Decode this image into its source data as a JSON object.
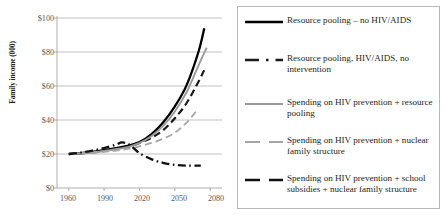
{
  "chart_data": {
    "type": "line",
    "title": "",
    "xlabel": "",
    "ylabel": "Family income (000)",
    "xlim": [
      1950,
      2090
    ],
    "ylim": [
      0,
      100
    ],
    "xticks": [
      "1960",
      "1990",
      "2020",
      "2050",
      "2080"
    ],
    "xtick_values": [
      1960,
      1990,
      2020,
      2050,
      2080
    ],
    "yticks": [
      "$0",
      "$20",
      "$40",
      "$60",
      "$80",
      "$100"
    ],
    "ytick_values": [
      0,
      20,
      40,
      60,
      80,
      100
    ],
    "grid": "horizontal",
    "legend_position": "right",
    "series": [
      {
        "name": "Resource pooling – no HIV/AIDS",
        "color": "#000000",
        "style": "solid",
        "width": 2.3,
        "x": [
          1960,
          1970,
          1980,
          1990,
          2000,
          2010,
          2020,
          2030,
          2040,
          2050,
          2060,
          2070,
          2075
        ],
        "values": [
          20,
          20.5,
          21.2,
          22.2,
          23.4,
          24.8,
          27.0,
          31.5,
          38.5,
          48.0,
          60.5,
          80.0,
          94.0
        ]
      },
      {
        "name": "Resource pooling, HIV/AIDS, no intervention",
        "color": "#1a1a1a",
        "style": "dashed",
        "width": 2.2,
        "x": [
          1960,
          1970,
          1980,
          1990,
          2000,
          2010,
          2020,
          2030,
          2040,
          2050,
          2060,
          2070,
          2075
        ],
        "values": [
          20,
          20.4,
          21.0,
          22.0,
          23.0,
          24.2,
          26.5,
          29.5,
          34.0,
          41.0,
          50.0,
          62.5,
          69.5
        ]
      },
      {
        "name": "Spending on HIV prevention + resource pooling",
        "color": "#9a9a9a",
        "style": "solid",
        "width": 1.9,
        "x": [
          1960,
          1970,
          1980,
          1990,
          2000,
          2010,
          2020,
          2030,
          2040,
          2050,
          2060,
          2070,
          2077
        ],
        "values": [
          20,
          20.4,
          21.0,
          21.8,
          22.8,
          24.0,
          26.5,
          30.5,
          36.5,
          45.0,
          56.5,
          72.0,
          82.5
        ]
      },
      {
        "name": "Spending on HIV prevention + nuclear family structure",
        "color": "#a6a6a6",
        "style": "dashed",
        "width": 1.8,
        "x": [
          1960,
          1970,
          1980,
          1990,
          2000,
          2010,
          2020,
          2030,
          2040,
          2050,
          2060,
          2068
        ],
        "values": [
          20,
          20.2,
          20.6,
          21.2,
          22.0,
          23.0,
          24.5,
          26.5,
          29.0,
          32.5,
          38.5,
          45.0
        ]
      },
      {
        "name": "Spending on HIV prevention + school subsidies + nuclear family structure",
        "color": "#111111",
        "style": "dashdot",
        "width": 2.3,
        "x": [
          1960,
          1970,
          1980,
          1990,
          2000,
          2005,
          2010,
          2015,
          2020,
          2030,
          2040,
          2050,
          2060,
          2072
        ],
        "values": [
          20,
          20.8,
          22.0,
          23.5,
          25.5,
          26.8,
          26.0,
          23.5,
          20.5,
          17.0,
          14.8,
          13.6,
          13.2,
          13.2
        ]
      }
    ]
  },
  "legend": {
    "items": [
      {
        "label": "Resource pooling – no HIV/AIDS",
        "swatch": "solid-black"
      },
      {
        "label": "Resource pooling, HIV/AIDS, no intervention",
        "swatch": "dashdot-black"
      },
      {
        "label": "Spending on HIV prevention + resource pooling",
        "swatch": "solid-gray"
      },
      {
        "label": "Spending on HIV prevention + nuclear family structure",
        "swatch": "dashed-gray"
      },
      {
        "label": "Spending on HIV prevention + school subsidies + nuclear family structure",
        "swatch": "dashed-black"
      }
    ]
  }
}
